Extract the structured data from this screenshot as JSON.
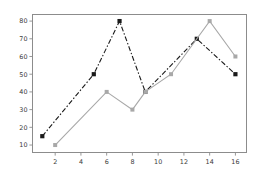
{
  "chart_data": {
    "type": "line",
    "title": "",
    "xlabel": "",
    "ylabel": "",
    "xlim": [
      0.2,
      16.9
    ],
    "ylim": [
      5.5,
      84.0
    ],
    "xticks": [
      2,
      4,
      6,
      8,
      10,
      12,
      14,
      16
    ],
    "yticks": [
      10,
      20,
      30,
      40,
      50,
      60,
      70,
      80
    ],
    "xtick_labels": [
      "2",
      "4",
      "6",
      "8",
      "10",
      "12",
      "14",
      "16"
    ],
    "ytick_labels": [
      "10",
      "20",
      "30",
      "40",
      "50",
      "60",
      "70",
      "80"
    ],
    "grid": false,
    "legend": "none",
    "series": [
      {
        "name": "series-dark",
        "color": "#1a1a1a",
        "linestyle": "dashdot",
        "marker": "square",
        "marker_size": 4.2,
        "linewidth": 1.1,
        "x": [
          1,
          5,
          7,
          9,
          13,
          16
        ],
        "y": [
          15,
          50,
          80,
          40,
          70,
          50
        ]
      },
      {
        "name": "series-gray",
        "color": "#a8a8a8",
        "linestyle": "solid",
        "marker": "square",
        "marker_size": 4.0,
        "linewidth": 1.1,
        "x": [
          2,
          6,
          8,
          9,
          11,
          14,
          16
        ],
        "y": [
          10,
          40,
          30,
          40,
          50,
          80,
          60
        ]
      }
    ]
  },
  "figure": {
    "background": "#ffffff",
    "plot_area": {
      "left": 32,
      "top": 14,
      "right": 247,
      "bottom": 153
    },
    "spine_color": "#8c8c8c",
    "tick_color": "#3a3a3a"
  }
}
